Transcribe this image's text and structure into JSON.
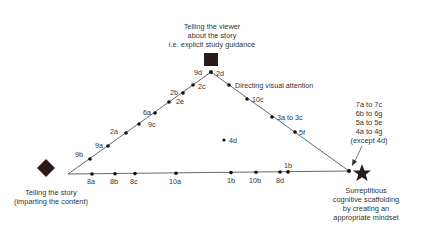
{
  "diagram": {
    "vertices": {
      "top": {
        "label_lines": [
          "Telling the viewer",
          "about the story",
          "i.e. explicit study guidance"
        ],
        "marker": "square-icon"
      },
      "left": {
        "label_lines": [
          "Telling the story",
          "(imparting the content)"
        ],
        "marker": "diamond-icon"
      },
      "right": {
        "label_lines": [
          "Surreptitious",
          "cognitive scaffolding",
          "by creating an",
          "appropriate mindset"
        ],
        "marker": "star-icon"
      }
    },
    "right_annotation": [
      "7a to 7c",
      "6b to 6g",
      "5a to 5e",
      "4a to 4g",
      "(except 4d)"
    ],
    "left_edge_points": [
      "9b",
      "9a",
      "2a",
      "9c",
      "6a",
      "2e",
      "2b",
      "2c",
      "9d"
    ],
    "right_edge_points": [
      "2d",
      "Directing visual attention",
      "10c",
      "3a to 3c",
      "5f"
    ],
    "base_points": [
      "8a",
      "8b",
      "8c",
      "10a",
      "1b",
      "10b",
      "8d",
      "1b"
    ],
    "interior_points": [
      "4d"
    ],
    "colors": {
      "marker": "#2a1a1a",
      "line": "#555555",
      "text": "#333333"
    }
  }
}
